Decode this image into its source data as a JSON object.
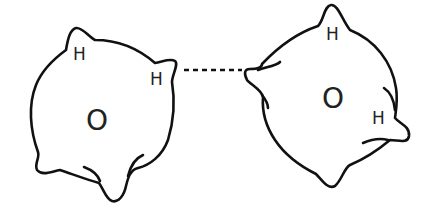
{
  "diagram": {
    "molecules": [
      {
        "id": "left",
        "oxygen_label": "O",
        "hydrogen_labels": [
          "H",
          "H"
        ]
      },
      {
        "id": "right",
        "oxygen_label": "O",
        "hydrogen_labels": [
          "H",
          "H"
        ]
      }
    ],
    "bond": {
      "type": "hydrogen-bond",
      "style": "dashed"
    },
    "colors": {
      "stroke": "#111111",
      "background": "#ffffff"
    }
  }
}
